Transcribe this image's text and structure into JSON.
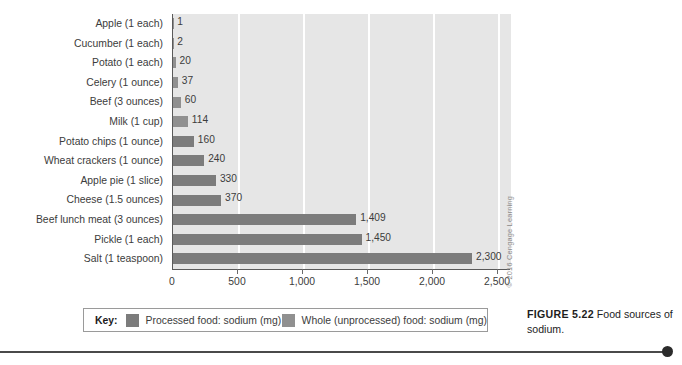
{
  "chart_data": {
    "type": "bar",
    "orientation": "horizontal",
    "title": "",
    "xlabel": "",
    "ylabel": "",
    "xlim": [
      0,
      2600
    ],
    "xticks": [
      0,
      500,
      1000,
      1500,
      2000,
      2500
    ],
    "xtick_labels": [
      "0",
      "500",
      "1,000",
      "1,500",
      "2,000",
      "2,500"
    ],
    "grid": "vertical-white",
    "legend_position": "below-plot",
    "categories": [
      "Apple (1 each)",
      "Cucumber (1 each)",
      "Potato (1 each)",
      "Celery (1 ounce)",
      "Beef (3 ounces)",
      "Milk (1 cup)",
      "Potato chips (1 ounce)",
      "Wheat crackers (1 ounce)",
      "Apple pie (1 slice)",
      "Cheese (1.5 ounces)",
      "Beef lunch meat (3 ounces)",
      "Pickle (1 each)",
      "Salt (1 teaspoon)"
    ],
    "values": [
      1,
      2,
      20,
      37,
      60,
      114,
      160,
      240,
      330,
      370,
      1409,
      1450,
      2300
    ],
    "value_labels": [
      "1",
      "2",
      "20",
      "37",
      "60",
      "114",
      "160",
      "240",
      "330",
      "370",
      "1,409",
      "1,450",
      "2,300"
    ],
    "series_of_point": [
      "whole",
      "whole",
      "whole",
      "whole",
      "whole",
      "whole",
      "processed",
      "processed",
      "processed",
      "processed",
      "processed",
      "processed",
      "processed"
    ],
    "series": [
      {
        "name": "Processed food: sodium (mg)",
        "key": "processed",
        "color": "#7c7c7c"
      },
      {
        "name": "Whole (unprocessed) food: sodium (mg)",
        "key": "whole",
        "color": "#909090"
      }
    ]
  },
  "legend": {
    "title": "Key:",
    "entries": [
      {
        "label": "Processed food: sodium (mg)",
        "color": "#7c7c7c"
      },
      {
        "label": "Whole (unprocessed) food: sodium (mg)",
        "color": "#909090"
      }
    ]
  },
  "caption": {
    "label": "FIGURE 5.22",
    "text": " Food sources of sodium."
  },
  "copyright": "© 2016 Cengage Learning",
  "colors": {
    "plot_background": "#e6e6e6",
    "gridline": "#ffffff",
    "axis": "#5a5a5a",
    "processed_bar": "#7c7c7c",
    "whole_bar": "#909090",
    "text": "#3c3c3c",
    "rule": "#4a4a4a"
  }
}
